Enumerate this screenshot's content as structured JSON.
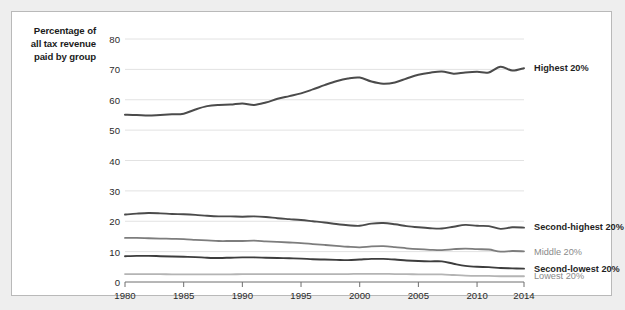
{
  "figure": {
    "background": "#ffffff",
    "border_color": "#b9b9b9",
    "page_background": "#eeeeee"
  },
  "axis_title": {
    "line1": "Percentage of",
    "line2": "all tax revenue",
    "line3": "paid by group"
  },
  "chart_data": {
    "type": "line",
    "title": "",
    "subtitle": "",
    "xlabel": "",
    "ylabel": "Percentage of all tax revenue paid by group",
    "xlim": [
      1980,
      2014
    ],
    "ylim": [
      0,
      80
    ],
    "xticks": [
      1980,
      1985,
      1990,
      1995,
      2000,
      2005,
      2010,
      2014
    ],
    "yticks": [
      0,
      10,
      20,
      30,
      40,
      50,
      60,
      70,
      80
    ],
    "grid": "horizontal",
    "legend_position": "right-inline",
    "x": [
      1980,
      1981,
      1982,
      1983,
      1984,
      1985,
      1986,
      1987,
      1988,
      1989,
      1990,
      1991,
      1992,
      1993,
      1994,
      1995,
      1996,
      1997,
      1998,
      1999,
      2000,
      2001,
      2002,
      2003,
      2004,
      2005,
      2006,
      2007,
      2008,
      2009,
      2010,
      2011,
      2012,
      2013,
      2014
    ],
    "series": [
      {
        "name": "Highest 20%",
        "color": "#4b4b4b",
        "width": 2.0,
        "label_value": 70.5,
        "values": [
          55.1,
          55.0,
          54.8,
          55.0,
          55.2,
          55.4,
          56.8,
          57.9,
          58.3,
          58.4,
          58.8,
          58.3,
          59.1,
          60.3,
          61.2,
          62.1,
          63.4,
          64.8,
          66.1,
          67.0,
          67.3,
          66.0,
          65.3,
          65.7,
          67.0,
          68.2,
          68.9,
          69.3,
          68.6,
          69.0,
          69.2,
          69.0,
          70.9,
          69.6,
          70.4
        ]
      },
      {
        "name": "Second-highest 20%",
        "color": "#4b4b4b",
        "width": 1.9,
        "label_value": 18.0,
        "values": [
          22.2,
          22.5,
          22.7,
          22.6,
          22.4,
          22.3,
          22.1,
          21.8,
          21.6,
          21.6,
          21.5,
          21.6,
          21.4,
          21.0,
          20.7,
          20.4,
          20.0,
          19.6,
          19.1,
          18.7,
          18.5,
          19.2,
          19.4,
          19.0,
          18.4,
          18.0,
          17.7,
          17.6,
          18.2,
          18.8,
          18.5,
          18.4,
          17.5,
          18.0,
          17.9
        ]
      },
      {
        "name": "Middle 20%",
        "color": "#7d7d7d",
        "width": 1.8,
        "label_value": 10.0,
        "values": [
          14.5,
          14.5,
          14.4,
          14.3,
          14.2,
          14.1,
          13.9,
          13.7,
          13.5,
          13.5,
          13.5,
          13.6,
          13.4,
          13.2,
          13.0,
          12.8,
          12.5,
          12.2,
          11.9,
          11.6,
          11.4,
          11.7,
          11.8,
          11.5,
          11.1,
          10.8,
          10.6,
          10.5,
          10.8,
          11.0,
          10.8,
          10.7,
          10.0,
          10.2,
          10.1
        ]
      },
      {
        "name": "Second-lowest 20%",
        "color": "#3d3d3d",
        "width": 1.9,
        "label_value": 4.2,
        "values": [
          8.5,
          8.6,
          8.6,
          8.5,
          8.4,
          8.3,
          8.2,
          8.0,
          7.9,
          8.0,
          8.1,
          8.1,
          8.0,
          7.9,
          7.8,
          7.7,
          7.5,
          7.4,
          7.3,
          7.2,
          7.4,
          7.6,
          7.6,
          7.4,
          7.1,
          6.9,
          6.8,
          6.8,
          6.0,
          5.3,
          5.0,
          4.9,
          4.6,
          4.5,
          4.4
        ]
      },
      {
        "name": "Lowest 20%",
        "color": "#b4b4b4",
        "width": 1.8,
        "label_value": 2.0,
        "values": [
          2.6,
          2.6,
          2.6,
          2.6,
          2.5,
          2.5,
          2.5,
          2.5,
          2.5,
          2.5,
          2.6,
          2.6,
          2.6,
          2.6,
          2.6,
          2.6,
          2.6,
          2.6,
          2.6,
          2.6,
          2.7,
          2.7,
          2.7,
          2.6,
          2.6,
          2.5,
          2.5,
          2.5,
          2.3,
          2.1,
          2.0,
          2.0,
          1.9,
          1.9,
          1.9
        ]
      }
    ]
  }
}
